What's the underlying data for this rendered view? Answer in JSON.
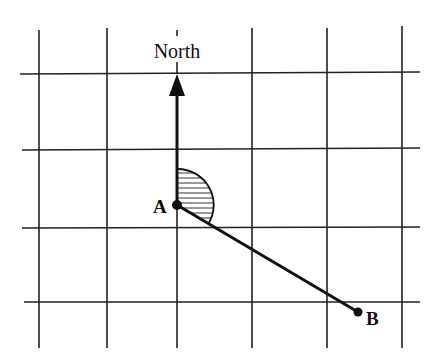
{
  "diagram": {
    "labels": {
      "north": "North",
      "point_a": "A",
      "point_b": "B"
    },
    "grid": {
      "x_lines": [
        39,
        107,
        177,
        252,
        327,
        402
      ],
      "y_lines": [
        74,
        150,
        228,
        302
      ],
      "color": "#222222"
    },
    "points": {
      "A": {
        "x": 177,
        "y": 205
      },
      "B": {
        "x": 358,
        "y": 312
      }
    },
    "north_arrow": {
      "from_y": 205,
      "tip_y": 74
    },
    "bearing_angle": {
      "description": "hatched sector from North clockwise to line AB",
      "radius": 36
    }
  }
}
